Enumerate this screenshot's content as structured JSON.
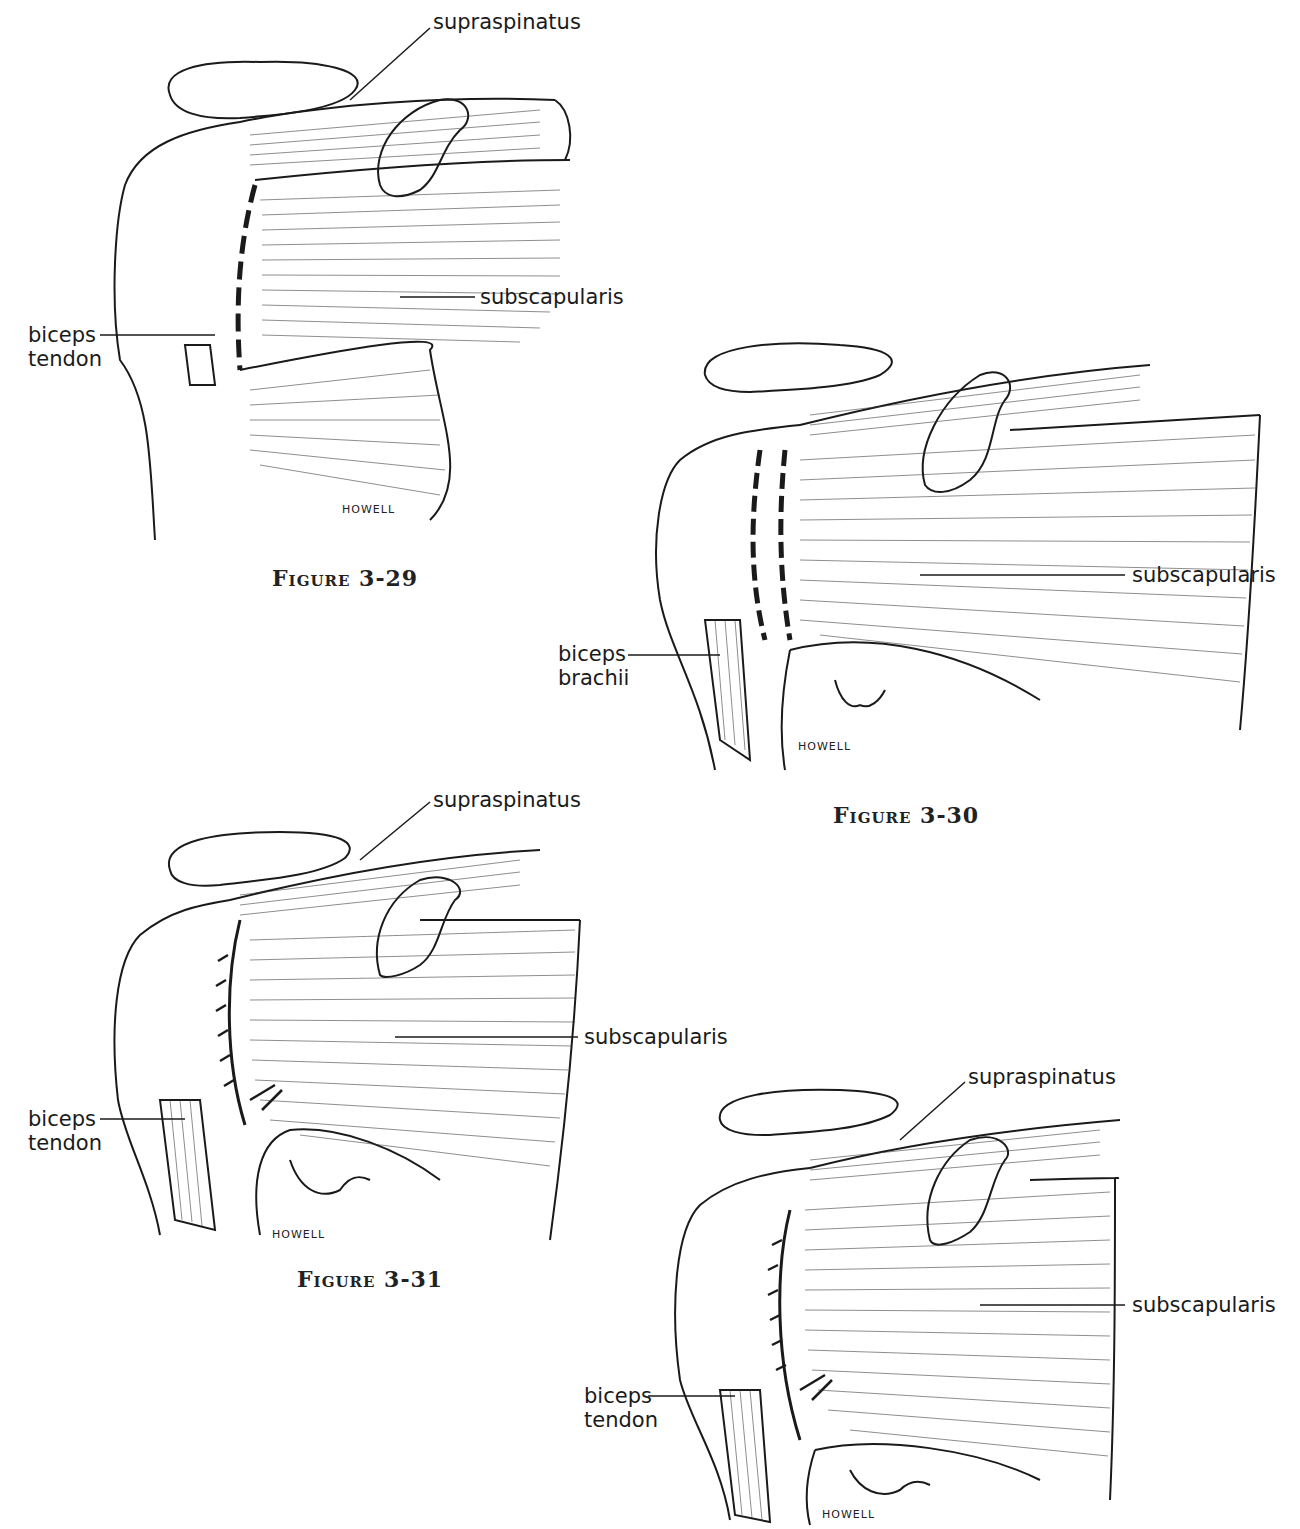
{
  "figures": [
    {
      "caption": "Figure 3-29",
      "signature": "HOWELL",
      "labels": {
        "supraspinatus": "supraspinatus",
        "subscapularis": "subscapularis",
        "biceps_line1": "biceps",
        "biceps_line2": "tendon"
      }
    },
    {
      "caption": "Figure 3-30",
      "signature": "HOWELL",
      "labels": {
        "subscapularis": "subscapularis",
        "biceps_line1": "biceps",
        "biceps_line2": "brachii"
      }
    },
    {
      "caption": "Figure 3-31",
      "signature": "HOWELL",
      "labels": {
        "supraspinatus": "supraspinatus",
        "subscapularis": "subscapularis",
        "biceps_line1": "biceps",
        "biceps_line2": "tendon"
      }
    },
    {
      "caption": "",
      "signature": "HOWELL",
      "labels": {
        "supraspinatus": "supraspinatus",
        "subscapularis": "subscapularis",
        "biceps_line1": "biceps",
        "biceps_line2": "tendon"
      }
    }
  ]
}
